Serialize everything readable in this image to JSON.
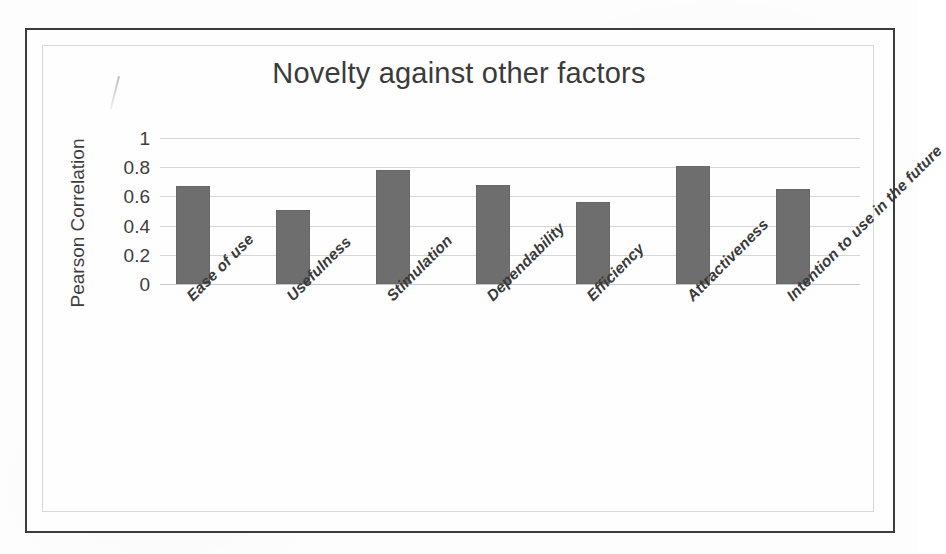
{
  "chart_data": {
    "type": "bar",
    "title": "Novelty against other factors",
    "xlabel": "",
    "ylabel": "Pearson Correlation",
    "categories": [
      "Ease of use",
      "Usefulness",
      "Stimulation",
      "Dependability",
      "Efficiency",
      "Attractiveness",
      "Intention to use in the future"
    ],
    "values": [
      0.67,
      0.51,
      0.78,
      0.68,
      0.56,
      0.81,
      0.65
    ],
    "ylim": [
      0,
      1
    ],
    "ytick_labels": [
      "1",
      "0.8",
      "0.6",
      "0.4",
      "0.2",
      "0"
    ],
    "ytick_values": [
      1,
      0.8,
      0.6,
      0.4,
      0.2,
      0
    ],
    "grid": true,
    "legend": "none",
    "series_color": "#6e6e6e",
    "gridline_color": "#d6d6d6",
    "text_color": "#3b3b3b"
  },
  "figure": {
    "border_color": "#3c3c3c",
    "plot_border_color": "#d8d8d8",
    "background": "#fdfdfd",
    "artifact_name": "pen-stroke-mark"
  }
}
